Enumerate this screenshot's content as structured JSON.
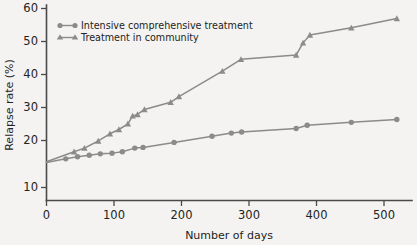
{
  "chart_data": {
    "type": "line",
    "title": "",
    "xlabel": "Number of days",
    "ylabel": "Relapse rate (%)",
    "xlim": [
      0,
      530
    ],
    "ylim": [
      5,
      60
    ],
    "xticks": [
      0,
      100,
      200,
      300,
      400,
      500
    ],
    "yticks": [
      10,
      20,
      30,
      40,
      50,
      60
    ],
    "grid": false,
    "legend_position": "top-left",
    "series": [
      {
        "name": "Intensive comprehensive treatment",
        "marker": "circle",
        "color": "#8b8b8b",
        "points": [
          {
            "x": 0,
            "y": 17.0
          },
          {
            "x": 28,
            "y": 18.0
          },
          {
            "x": 45,
            "y": 18.6
          },
          {
            "x": 62,
            "y": 19.0
          },
          {
            "x": 78,
            "y": 19.4
          },
          {
            "x": 95,
            "y": 19.6
          },
          {
            "x": 110,
            "y": 20.0
          },
          {
            "x": 128,
            "y": 21.0
          },
          {
            "x": 140,
            "y": 21.2
          },
          {
            "x": 185,
            "y": 22.6
          },
          {
            "x": 240,
            "y": 24.3
          },
          {
            "x": 268,
            "y": 25.2
          },
          {
            "x": 283,
            "y": 25.5
          },
          {
            "x": 362,
            "y": 26.5
          },
          {
            "x": 378,
            "y": 27.4
          },
          {
            "x": 442,
            "y": 28.2
          },
          {
            "x": 508,
            "y": 29.0
          }
        ]
      },
      {
        "name": "Treatment in community",
        "marker": "triangle",
        "color": "#8b8b8b",
        "points": [
          {
            "x": 0,
            "y": 17.2
          },
          {
            "x": 40,
            "y": 20.0
          },
          {
            "x": 55,
            "y": 21.0
          },
          {
            "x": 75,
            "y": 23.0
          },
          {
            "x": 92,
            "y": 25.0
          },
          {
            "x": 105,
            "y": 26.2
          },
          {
            "x": 118,
            "y": 27.8
          },
          {
            "x": 125,
            "y": 30.0
          },
          {
            "x": 132,
            "y": 30.4
          },
          {
            "x": 142,
            "y": 31.8
          },
          {
            "x": 180,
            "y": 33.8
          },
          {
            "x": 192,
            "y": 35.4
          },
          {
            "x": 255,
            "y": 42.5
          },
          {
            "x": 282,
            "y": 45.8
          },
          {
            "x": 362,
            "y": 47.0
          },
          {
            "x": 372,
            "y": 50.4
          },
          {
            "x": 382,
            "y": 52.6
          },
          {
            "x": 442,
            "y": 54.6
          },
          {
            "x": 508,
            "y": 57.2
          }
        ]
      }
    ]
  },
  "legend": {
    "items": [
      {
        "label": "Intensive comprehensive treatment",
        "marker": "circle"
      },
      {
        "label": "Treatment in community",
        "marker": "triangle"
      }
    ]
  },
  "axis": {
    "y_title": "Relapse rate (%)",
    "x_title": "Number of days",
    "y_tick_labels": [
      "60",
      "50",
      "40",
      "30",
      "20",
      "10"
    ],
    "x_tick_labels": [
      "0",
      "100",
      "200",
      "300",
      "400",
      "500"
    ]
  }
}
